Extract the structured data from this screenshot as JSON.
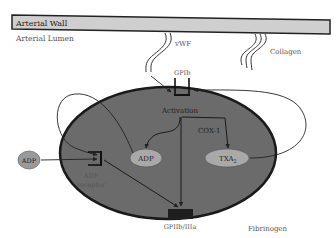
{
  "diagram": {
    "type": "platelet-activation-schematic",
    "labels": {
      "arterial_wall": "Arterial Wall",
      "arterial_lumen": "Arterial Lumen",
      "vwf": "vWF",
      "collagen": "Collagen",
      "gpib": "GPIb",
      "activation": "Activation",
      "cox1": "COX-1",
      "adp_inner": "ADP",
      "txa2_main": "TXA",
      "txa2_sub": "2",
      "adp_outer": "ADP",
      "adp_receptor_line1": "ADP",
      "adp_receptor_line2": "receptor",
      "gpiib_iiia": "GPIIb/IIIa",
      "fibrinogen": "Fibrinogen"
    },
    "colors": {
      "wall_fill": "#cfcfcf",
      "wall_stroke": "#222222",
      "platelet_fill": "#6b6b6b",
      "platelet_stroke": "#1a1a1a",
      "granule_fill": "#a9a9a9",
      "receptor_block": "#1e1e1e",
      "arrow": "#222222",
      "text": "#555555"
    },
    "edges": [
      {
        "from": "vWF",
        "to": "GPIb"
      },
      {
        "from": "TXA2",
        "to": "GPIb"
      },
      {
        "from": "ADP (inner)",
        "to": "ADP receptor"
      },
      {
        "from": "ADP (outer)",
        "to": "ADP receptor"
      },
      {
        "from": "Activation",
        "to": "ADP (inner)"
      },
      {
        "from": "COX-1",
        "to": "TXA2"
      },
      {
        "from": "ADP receptor",
        "to": "GPIIb/IIIa"
      },
      {
        "from": "Activation",
        "to": "GPIIb/IIIa"
      }
    ]
  }
}
